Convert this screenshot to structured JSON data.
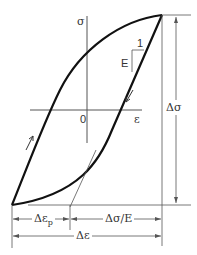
{
  "diagram": {
    "type": "stress-strain hysteresis loop",
    "axes": {
      "y_label": "σ",
      "x_label": "ε",
      "origin_label": "0"
    },
    "slope_triangle": {
      "run_label": "1",
      "rise_label": "E"
    },
    "dimensions": {
      "stress_range": "Δσ",
      "plastic_strain_base": "Δε",
      "plastic_strain_sub": "p",
      "elastic_strain": "Δσ/E",
      "total_strain": "Δε"
    },
    "colors": {
      "loop": "#111111",
      "lines": "#555555",
      "background": "#ffffff"
    }
  }
}
